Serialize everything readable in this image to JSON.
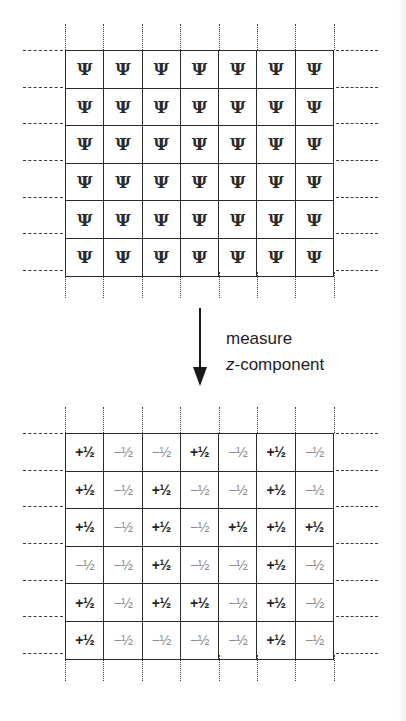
{
  "diagram": {
    "top_grid": {
      "symbol": "Ψ",
      "rows": 6,
      "cols": 7,
      "cells": [
        [
          "Ψ",
          "Ψ",
          "Ψ",
          "Ψ",
          "Ψ",
          "Ψ",
          "Ψ"
        ],
        [
          "Ψ",
          "Ψ",
          "Ψ",
          "Ψ",
          "Ψ",
          "Ψ",
          "Ψ"
        ],
        [
          "Ψ",
          "Ψ",
          "Ψ",
          "Ψ",
          "Ψ",
          "Ψ",
          "Ψ"
        ],
        [
          "Ψ",
          "Ψ",
          "Ψ",
          "Ψ",
          "Ψ",
          "Ψ",
          "Ψ"
        ],
        [
          "Ψ",
          "Ψ",
          "Ψ",
          "Ψ",
          "Ψ",
          "Ψ",
          "Ψ"
        ],
        [
          "Ψ",
          "Ψ",
          "Ψ",
          "Ψ",
          "Ψ",
          "Ψ",
          "Ψ"
        ]
      ]
    },
    "arrow": {
      "direction": "down",
      "label_line1": "measure",
      "label_line2_italic": "z",
      "label_line2_rest": "-component"
    },
    "bottom_grid": {
      "rows": 6,
      "cols": 7,
      "cells": [
        [
          "+½",
          "−½",
          "−½",
          "+½",
          "−½",
          "+½",
          "−½"
        ],
        [
          "+½",
          "−½",
          "+½",
          "−½",
          "−½",
          "+½",
          "−½"
        ],
        [
          "+½",
          "−½",
          "+½",
          "−½",
          "+½",
          "+½",
          "+½"
        ],
        [
          "−½",
          "−½",
          "+½",
          "−½",
          "−½",
          "+½",
          "−½"
        ],
        [
          "+½",
          "−½",
          "+½",
          "+½",
          "−½",
          "+½",
          "−½"
        ],
        [
          "+½",
          "−½",
          "−½",
          "−½",
          "−½",
          "+½",
          "−½"
        ]
      ]
    },
    "colors": {
      "line": "#2b2b2b",
      "spin_up": "#262626",
      "spin_down": "#8c8c8c"
    }
  }
}
